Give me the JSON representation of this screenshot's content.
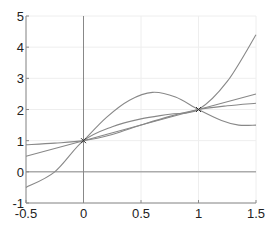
{
  "chart_data": {
    "type": "line",
    "title": "",
    "xlabel": "",
    "ylabel": "",
    "xlim": [
      -0.5,
      1.5
    ],
    "ylim": [
      -1,
      5
    ],
    "grid": true,
    "legend": null,
    "x_ticks": [
      "-0.5",
      "0",
      "0.5",
      "1",
      "1.5"
    ],
    "x_tick_values": [
      -0.5,
      0,
      0.5,
      1,
      1.5
    ],
    "y_ticks": [
      "-1",
      "0",
      "1",
      "2",
      "3",
      "4",
      "5"
    ],
    "y_tick_values": [
      -1,
      0,
      1,
      2,
      3,
      4,
      5
    ],
    "reference_lines": [
      {
        "orientation": "vertical",
        "value": 0
      },
      {
        "orientation": "horizontal",
        "value": 0
      }
    ],
    "markers": [
      {
        "x": 0,
        "y": 1,
        "symbol": "x"
      },
      {
        "x": 1,
        "y": 2,
        "symbol": "x"
      }
    ],
    "series": [
      {
        "name": "steep-cubic",
        "x": [
          -0.5,
          -0.25,
          0,
          0.25,
          0.5,
          0.75,
          1,
          1.25,
          1.5
        ],
        "y": [
          -0.5,
          0.0,
          1.0,
          1.45,
          1.7,
          1.85,
          2.0,
          2.9,
          4.4
        ]
      },
      {
        "name": "linear",
        "x": [
          -0.5,
          0,
          0.5,
          1,
          1.5
        ],
        "y": [
          0.5,
          1.0,
          1.5,
          2.0,
          2.5
        ]
      },
      {
        "name": "wavy",
        "x": [
          0,
          0.2,
          0.4,
          0.6,
          0.8,
          1,
          1.2,
          1.35,
          1.5
        ],
        "y": [
          1.0,
          1.75,
          2.3,
          2.55,
          2.4,
          2.0,
          1.65,
          1.5,
          1.5
        ]
      },
      {
        "name": "flat",
        "x": [
          -0.5,
          -0.25,
          0,
          0.25,
          0.5,
          0.75,
          1,
          1.25,
          1.5
        ],
        "y": [
          0.87,
          0.92,
          1.0,
          1.2,
          1.5,
          1.78,
          2.0,
          2.12,
          2.2
        ]
      }
    ]
  },
  "style": {
    "curve_color": "#888888",
    "axis_color": "#888888",
    "grid_color": "#eeeeee",
    "marker_color": "#333333"
  }
}
